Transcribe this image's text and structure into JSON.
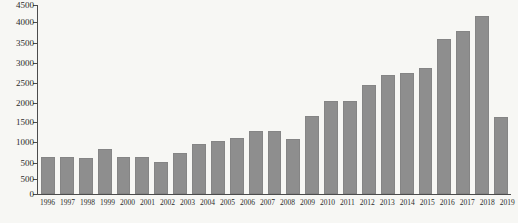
{
  "chart_data": {
    "type": "bar",
    "title": "",
    "xlabel": "",
    "ylabel": "",
    "categories": [
      "1996",
      "1997",
      "1998",
      "1999",
      "2000",
      "2001",
      "2002",
      "2003",
      "2004",
      "2005",
      "2006",
      "2007",
      "2008",
      "2009",
      "2010",
      "2011",
      "2012",
      "2013",
      "2014",
      "2015",
      "2016",
      "2017",
      "2018",
      "2019",
      "2020"
    ],
    "values": [
      660,
      640,
      620,
      860,
      650,
      645,
      530,
      760,
      970,
      1050,
      1130,
      1320,
      1320,
      1120,
      1680,
      2060,
      2060,
      2470,
      2740,
      2770,
      2910,
      3640,
      3850,
      4220,
      1660
    ],
    "y_axis": {
      "tick_labels_top_to_bottom": [
        "4500",
        "4000",
        "3500",
        "3000",
        "2500",
        "2000",
        "1500",
        "1000",
        "500",
        "500",
        "0"
      ],
      "tick_fractions_from_bottom": [
        0,
        0.079,
        0.164,
        0.27,
        0.376,
        0.481,
        0.587,
        0.693,
        0.799,
        0.905,
        1.0
      ],
      "note": "axis shows a duplicated 500 label; bottom two segments compressed",
      "range_bottom": 0,
      "range_top": 4500,
      "value_at_upper_500_tick": 500
    },
    "grid": false,
    "legend": false,
    "bar_color": "#8e8e8e",
    "axis_color": "#4c4c4c",
    "text_color": "#2b2b2b",
    "background_color": "#f7f7f4"
  }
}
